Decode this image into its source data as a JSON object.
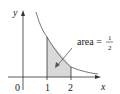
{
  "diagram": {
    "function": "y = 1/x^2",
    "axes": {
      "x_label": "x",
      "y_label": "y",
      "origin_label": "0"
    },
    "ticks": [
      {
        "value": 1,
        "label": "1"
      },
      {
        "value": 2,
        "label": "2"
      }
    ],
    "shaded_region": {
      "from": 1,
      "to": 2,
      "color": "#d9d9d9"
    },
    "annotation": {
      "text": "area =",
      "numerator": "1",
      "denominator": "2"
    },
    "colors": {
      "curve": "#555555",
      "axis": "#333333",
      "fill": "#d9d9d9"
    }
  }
}
